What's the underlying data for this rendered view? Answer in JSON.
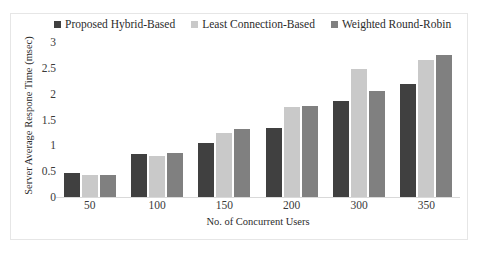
{
  "chart_data": {
    "type": "bar",
    "title": "",
    "xlabel": "No. of Concurrent Users",
    "ylabel": "Server Average Respone Time (msec)",
    "categories": [
      "50",
      "100",
      "150",
      "200",
      "300",
      "350"
    ],
    "series": [
      {
        "name": "Proposed Hybrid-Based",
        "color": "#404040",
        "values": [
          0.48,
          0.85,
          1.06,
          1.35,
          1.88,
          2.21
        ]
      },
      {
        "name": "Least Connection-Based",
        "color": "#c9c9c9",
        "values": [
          0.44,
          0.82,
          1.25,
          1.77,
          2.49,
          2.67
        ]
      },
      {
        "name": "Weighted  Round-Robin",
        "color": "#808080",
        "values": [
          0.44,
          0.88,
          1.33,
          1.79,
          2.08,
          2.77
        ]
      }
    ],
    "yticks": [
      "0",
      "0.5",
      "1",
      "1.5",
      "2",
      "2.5",
      "3"
    ],
    "ylim": [
      0,
      3
    ],
    "grid": false,
    "legend_position": "top"
  }
}
